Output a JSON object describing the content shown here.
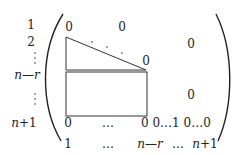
{
  "diagram": {
    "type": "matrix-structure",
    "row_labels": [
      "1",
      "2",
      "⋮",
      "n—r",
      "⋮",
      "n+1"
    ],
    "column_labels": [
      "1",
      "…",
      "n—r",
      "…",
      "n+1"
    ],
    "entries": {
      "top_left_zero": "0",
      "top_mid_zero": "0",
      "diag_dots": ". . .",
      "diag_end_zero": "0",
      "right_upper_zero": "0",
      "right_lower_zero": "0",
      "bottom_row_first": "0",
      "bottom_row_ellipsis": "…",
      "bottom_row_tail": "0 0…1 0…0"
    },
    "colors": {
      "ink": "#222222",
      "background": "#ffffff"
    }
  }
}
